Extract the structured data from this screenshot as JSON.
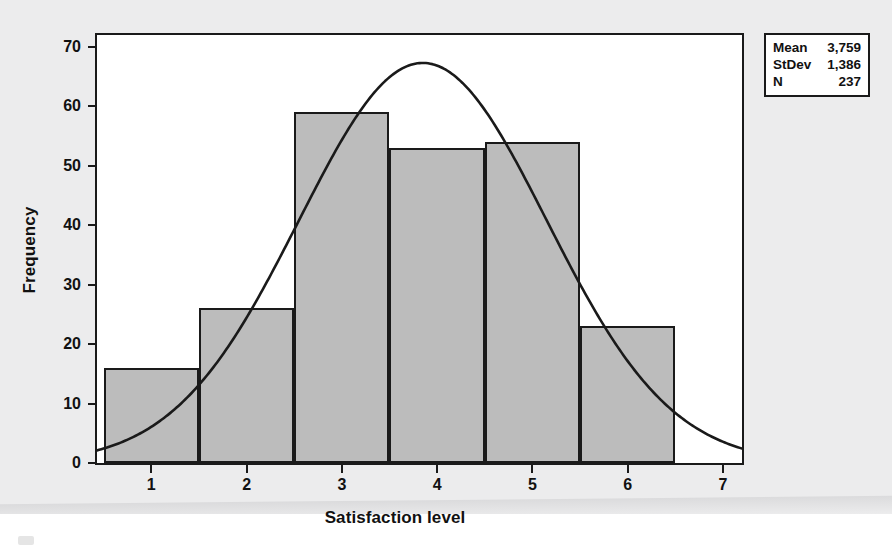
{
  "chart_data": {
    "type": "bar",
    "title": "",
    "subtitle": "",
    "xlabel": "Satisfaction level",
    "ylabel": "Frequency",
    "categories": [
      "1",
      "2",
      "3",
      "4",
      "5",
      "6"
    ],
    "values": [
      16,
      26,
      59,
      53,
      54,
      23
    ],
    "bin_centers": [
      1,
      2,
      3,
      4,
      5,
      6
    ],
    "bin_width": 1,
    "xlim": [
      0.43,
      7.2
    ],
    "ylim": [
      0,
      72
    ],
    "xticks": [
      1,
      2,
      3,
      4,
      5,
      6,
      7
    ],
    "yticks": [
      0,
      10,
      20,
      30,
      40,
      50,
      60,
      70
    ],
    "grid": false,
    "legend_position": "top-right-outside",
    "series": [
      {
        "name": "Frequency",
        "type": "bar",
        "values": [
          16,
          26,
          59,
          53,
          54,
          23
        ]
      },
      {
        "name": "Normal fit",
        "type": "line",
        "peak_x": 3.85,
        "peak_y": 67.3,
        "start_y": 2.6,
        "end_y": 1.6
      }
    ],
    "bar_fill_color": "#bcbcbc",
    "bar_edge_color": "#1a1a1a",
    "curve_color": "#1a1a1a"
  },
  "stats_box": {
    "rows": [
      {
        "name": "Mean",
        "value": "3,759"
      },
      {
        "name": "StDev",
        "value": "1,386"
      },
      {
        "name": "N",
        "value": "237"
      }
    ]
  },
  "axes": {
    "y_tick_labels": [
      "0",
      "10",
      "20",
      "30",
      "40",
      "50",
      "60",
      "70"
    ],
    "x_tick_labels": [
      "1",
      "2",
      "3",
      "4",
      "5",
      "6",
      "7"
    ],
    "y_title": "Frequency",
    "x_title": "Satisfaction level"
  }
}
